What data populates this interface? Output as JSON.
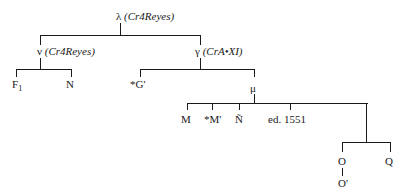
{
  "diagram": {
    "type": "stemma",
    "nodes": {
      "lambda": {
        "symbol": "λ",
        "annotation": "(Cr4Reyes)"
      },
      "nu": {
        "symbol": "ν",
        "annotation": "(Cr4Reyes)"
      },
      "gamma": {
        "symbol": "γ",
        "annotation": "(CrA•XI)"
      },
      "mu": {
        "symbol": "μ"
      },
      "F1": {
        "label": "F",
        "sub": "1"
      },
      "N": {
        "label": "N"
      },
      "G": {
        "label": "*G'"
      },
      "M": {
        "label": "M"
      },
      "Mstar": {
        "label": "*M'"
      },
      "Ntilde": {
        "label": "Ñ"
      },
      "ed1551": {
        "label": "ed. 1551"
      },
      "O": {
        "label": "O"
      },
      "Oprime": {
        "label": "O'"
      },
      "Q": {
        "label": "Q"
      }
    },
    "edges": [
      [
        "lambda",
        "nu"
      ],
      [
        "lambda",
        "gamma"
      ],
      [
        "nu",
        "F1"
      ],
      [
        "nu",
        "N"
      ],
      [
        "gamma",
        "G"
      ],
      [
        "gamma",
        "mu"
      ],
      [
        "mu",
        "M"
      ],
      [
        "mu",
        "Mstar"
      ],
      [
        "mu",
        "Ntilde"
      ],
      [
        "mu",
        "ed1551"
      ],
      [
        "mu",
        "OQ"
      ],
      [
        "OQ",
        "O"
      ],
      [
        "OQ",
        "Q"
      ],
      [
        "O",
        "Oprime"
      ]
    ]
  }
}
